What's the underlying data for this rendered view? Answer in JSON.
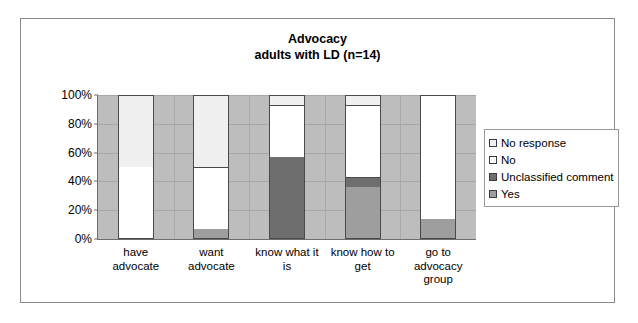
{
  "chart_data": {
    "type": "bar",
    "subtype": "100% stacked column",
    "title": "Advocacy",
    "subtitle": "adults with LD (n=14)",
    "xlabel": "",
    "ylabel": "",
    "ylim": [
      0,
      100
    ],
    "ytick_labels": [
      "0%",
      "20%",
      "40%",
      "60%",
      "80%",
      "100%"
    ],
    "ytick_values": [
      0,
      20,
      40,
      60,
      80,
      100
    ],
    "grid": true,
    "legend_position": "right",
    "plot_background": "#bdbdbd",
    "categories": [
      "have\nadvocate",
      "want\nadvocate",
      "know what it\nis",
      "know how to\nget",
      "go to\nadvocacy\ngroup"
    ],
    "category_lines": [
      [
        "have",
        "advocate"
      ],
      [
        "want",
        "advocate"
      ],
      [
        "know what it",
        "is"
      ],
      [
        "know how to",
        "get"
      ],
      [
        "go to",
        "advocacy",
        "group"
      ]
    ],
    "series": [
      {
        "name": "Yes",
        "color": "#9e9e9e",
        "values": [
          0,
          7,
          0,
          36,
          14
        ]
      },
      {
        "name": "Unclassified comment",
        "color": "#6e6e6e",
        "values": [
          0,
          0,
          57,
          7,
          0
        ]
      },
      {
        "name": "No",
        "color": "#ffffff",
        "values": [
          50,
          43,
          36,
          50,
          86
        ]
      },
      {
        "name": "No response",
        "color": "#f0f0f0",
        "values": [
          50,
          50,
          7,
          7,
          0
        ]
      }
    ],
    "legend_entries": [
      {
        "label": "No response",
        "color": "#f0f0f0"
      },
      {
        "label": "No",
        "color": "#ffffff"
      },
      {
        "label": "Unclassified comment",
        "color": "#6e6e6e"
      },
      {
        "label": "Yes",
        "color": "#9e9e9e"
      }
    ]
  }
}
